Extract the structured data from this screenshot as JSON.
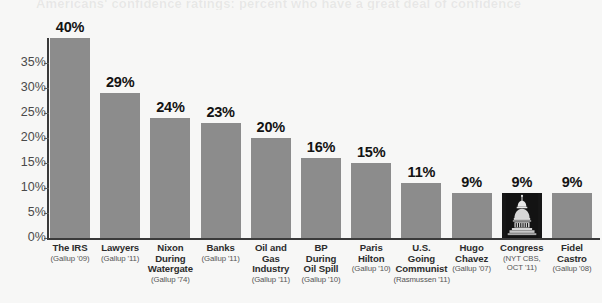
{
  "ghost_title": "Americans' confidence ratings: percent who have a great deal of confidence",
  "chart_data": {
    "type": "bar",
    "title": "",
    "subtitle": "",
    "xlabel": "",
    "ylabel": "",
    "ylim": [
      0,
      40
    ],
    "grid": false,
    "legend": null,
    "bar_color": "#8c8c8c",
    "highlight_color": "#171717",
    "background_color": "#f7f7f6",
    "axis_color": "#3a3a3a",
    "value_label_color": "#131313",
    "yticks": [
      "0%",
      "5%",
      "10%",
      "15%",
      "20%",
      "25%",
      "30%",
      "35%"
    ],
    "ytick_values": [
      0,
      5,
      10,
      15,
      20,
      25,
      30,
      35
    ],
    "categories": [
      "The IRS",
      "Lawyers",
      "Nixon During Watergate",
      "Banks",
      "Oil and Gas Industry",
      "BP During Oil Spill",
      "Paris Hilton",
      "U.S. Going Communist",
      "Hugo Chavez",
      "Congress",
      "Fidel Castro"
    ],
    "values": [
      40,
      29,
      24,
      23,
      20,
      16,
      15,
      11,
      9,
      9,
      9
    ],
    "value_labels": [
      "40%",
      "29%",
      "24%",
      "23%",
      "20%",
      "16%",
      "15%",
      "11%",
      "9%",
      "9%",
      "9%"
    ],
    "bars": [
      {
        "category": "The IRS",
        "label_lines": [
          "The IRS"
        ],
        "source": "(Gallup '09)",
        "value": 40,
        "value_label": "40%",
        "highlighted": false,
        "icon": null
      },
      {
        "category": "Lawyers",
        "label_lines": [
          "Lawyers"
        ],
        "source": "(Gallup '11)",
        "value": 29,
        "value_label": "29%",
        "highlighted": false,
        "icon": null
      },
      {
        "category": "Nixon During Watergate",
        "label_lines": [
          "Nixon",
          "During",
          "Watergate"
        ],
        "source": "(Gallup '74)",
        "value": 24,
        "value_label": "24%",
        "highlighted": false,
        "icon": null
      },
      {
        "category": "Banks",
        "label_lines": [
          "Banks"
        ],
        "source": "(Gallup '11)",
        "value": 23,
        "value_label": "23%",
        "highlighted": false,
        "icon": null
      },
      {
        "category": "Oil and Gas Industry",
        "label_lines": [
          "Oil and",
          "Gas",
          "Industry"
        ],
        "source": "(Gallup '11)",
        "value": 20,
        "value_label": "20%",
        "highlighted": false,
        "icon": null
      },
      {
        "category": "BP During Oil Spill",
        "label_lines": [
          "BP",
          "During",
          "Oil Spill"
        ],
        "source": "(Gallup '10)",
        "value": 16,
        "value_label": "16%",
        "highlighted": false,
        "icon": null
      },
      {
        "category": "Paris Hilton",
        "label_lines": [
          "Paris",
          "Hilton"
        ],
        "source": "(Gallup '10)",
        "value": 15,
        "value_label": "15%",
        "highlighted": false,
        "icon": null
      },
      {
        "category": "U.S. Going Communist",
        "label_lines": [
          "U.S.",
          "Going",
          "Communist"
        ],
        "source": "(Rasmussen '11)",
        "value": 11,
        "value_label": "11%",
        "highlighted": false,
        "icon": null
      },
      {
        "category": "Hugo Chavez",
        "label_lines": [
          "Hugo",
          "Chavez"
        ],
        "source": "(Gallup '07)",
        "value": 9,
        "value_label": "9%",
        "highlighted": false,
        "icon": null
      },
      {
        "category": "Congress",
        "label_lines": [
          "Congress"
        ],
        "source": "(NYT CBS, OCT '11)",
        "source_lines": [
          "(NYT CBS,",
          "OCT '11)"
        ],
        "value": 9,
        "value_label": "9%",
        "highlighted": true,
        "icon": "capitol-dome-icon"
      },
      {
        "category": "Fidel Castro",
        "label_lines": [
          "Fidel",
          "Castro"
        ],
        "source": "(Gallup '08)",
        "value": 9,
        "value_label": "9%",
        "highlighted": false,
        "icon": null
      }
    ]
  }
}
